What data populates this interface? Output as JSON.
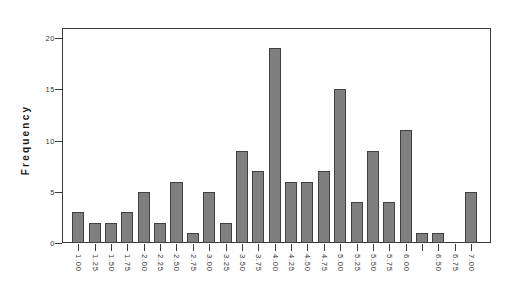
{
  "chart_data": {
    "type": "bar",
    "title": "",
    "subtitle": "",
    "xlabel": "",
    "ylabel": "Frequency",
    "ylim": [
      0,
      21
    ],
    "xlim": [
      0.875,
      7.125
    ],
    "grid": false,
    "legend": null,
    "bar_color": "#7f7f7f",
    "bar_edge_color": "#404040",
    "axis_color": "#3a3a3a",
    "background": "#ffffff",
    "bin_width": 0.25,
    "y_ticks": [
      0,
      5,
      10,
      15,
      20
    ],
    "y_tick_labels": [
      "0",
      "5",
      "10",
      "15",
      "20"
    ],
    "x_tick_labels": [
      "1.00",
      "1.25",
      "1.50",
      "1.75",
      "2.00",
      "2.25",
      "2.50",
      "2.75",
      "3.00",
      "3.25",
      "3.50",
      "3.75",
      "4.00",
      "4.25",
      "4.50",
      "4.75",
      "5.00",
      "5.25",
      "5.50",
      "5.75",
      "6.00",
      "",
      "6.50",
      "6.75",
      "7.00"
    ],
    "categories": [
      "1.00",
      "1.25",
      "1.50",
      "1.75",
      "2.00",
      "2.25",
      "2.50",
      "2.75",
      "3.00",
      "3.25",
      "3.50",
      "3.75",
      "4.00",
      "4.25",
      "4.50",
      "4.75",
      "5.00",
      "5.25",
      "5.50",
      "5.75",
      "6.00",
      "6.25",
      "6.50",
      "6.75",
      "7.00"
    ],
    "values": [
      3,
      2,
      2,
      3,
      5,
      2,
      6,
      1,
      5,
      2,
      9,
      7,
      19,
      6,
      6,
      7,
      15,
      4,
      9,
      4,
      11,
      1,
      1,
      0,
      5
    ]
  }
}
